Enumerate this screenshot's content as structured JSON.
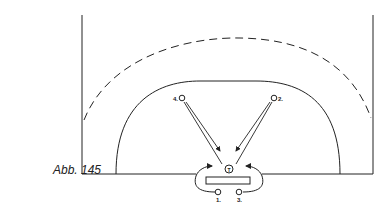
{
  "figure": {
    "caption": "Abb. 145",
    "player_center_label": "T",
    "positions": [
      {
        "label": "4.",
        "x": 182,
        "y": 98
      },
      {
        "label": "2.",
        "x": 274,
        "y": 98
      },
      {
        "label": "1.",
        "x": 218,
        "y": 192
      },
      {
        "label": "3.",
        "x": 239,
        "y": 192
      }
    ],
    "stroke_color": "#222222"
  }
}
